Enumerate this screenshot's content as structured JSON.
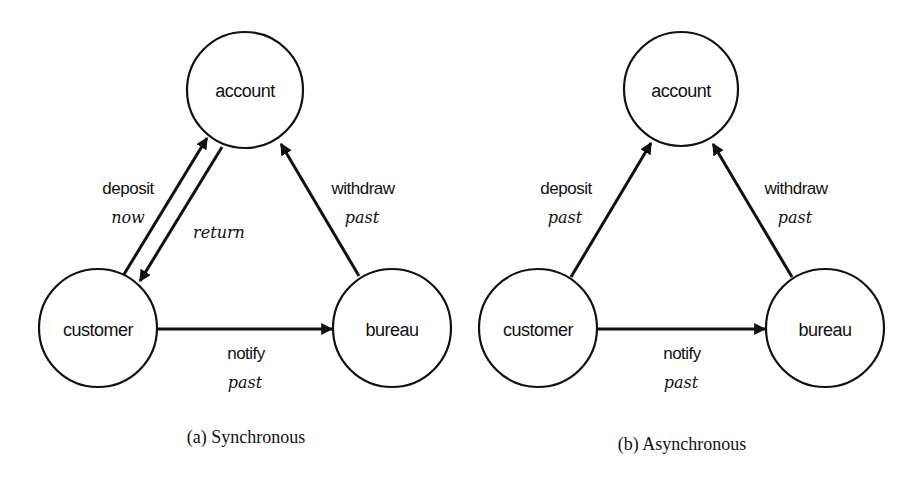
{
  "diagrams": [
    {
      "caption": "(a) Synchronous",
      "nodes": {
        "account": "account",
        "customer": "customer",
        "bureau": "bureau"
      },
      "edges": {
        "deposit": {
          "label": "deposit",
          "mode": "now"
        },
        "return": {
          "mode": "return"
        },
        "withdraw": {
          "label": "withdraw",
          "mode": "past"
        },
        "notify": {
          "label": "notify",
          "mode": "past"
        }
      }
    },
    {
      "caption": "(b) Asynchronous",
      "nodes": {
        "account": "account",
        "customer": "customer",
        "bureau": "bureau"
      },
      "edges": {
        "deposit": {
          "label": "deposit",
          "mode": "past"
        },
        "withdraw": {
          "label": "withdraw",
          "mode": "past"
        },
        "notify": {
          "label": "notify",
          "mode": "past"
        }
      }
    }
  ],
  "colors": {
    "stroke": "#111111",
    "background": "#ffffff"
  }
}
